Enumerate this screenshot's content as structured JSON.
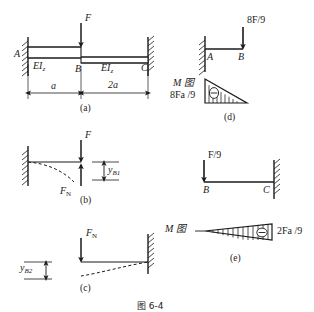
{
  "figure": {
    "caption": "图 6-4",
    "panels": [
      {
        "id": "a",
        "label": "(a)"
      },
      {
        "id": "b",
        "label": "(b)"
      },
      {
        "id": "c",
        "label": "(c)"
      },
      {
        "id": "d",
        "label": "(d)"
      },
      {
        "id": "e",
        "label": "(e)"
      }
    ]
  },
  "panel_a": {
    "name": "original-stepped-beam",
    "load_label": "F",
    "node_a": "A",
    "node_b": "B",
    "node_c": "C",
    "stiffness_left": "EI",
    "stiffness_left_sub": "z",
    "stiffness_right": "EI",
    "stiffness_right_sub": "z",
    "dim_left": "a",
    "dim_right": "2a",
    "caption": "(a)"
  },
  "panel_b": {
    "name": "cantilever-with-F-and-FN",
    "load_label": "F",
    "reaction_label": "F",
    "reaction_sub": "N",
    "deflection_label": "y",
    "deflection_sub": "B1",
    "caption": "(b)"
  },
  "panel_c": {
    "name": "cantilever-with-FN-only",
    "reaction_label": "F",
    "reaction_sub": "N",
    "deflection_label": "y",
    "deflection_sub": "B2",
    "caption": "(c)"
  },
  "panel_d": {
    "name": "segment-ab-moment-diagram",
    "load_label": "8F/9",
    "node_a": "A",
    "node_b": "B",
    "diagram_title": "M",
    "diagram_title_cn": "图",
    "moment_value": "8Fa /9",
    "caption": "(d)"
  },
  "panel_e": {
    "name": "segment-bc-moment-diagram",
    "load_label": "F/9",
    "node_b": "B",
    "node_c": "C",
    "diagram_title": "M",
    "diagram_title_cn": "图",
    "moment_value": "2Fa /9",
    "caption": "(e)"
  },
  "colors": {
    "ink": "#1a1a1a",
    "background": "#ffffff"
  }
}
